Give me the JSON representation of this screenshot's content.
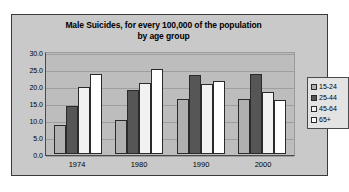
{
  "chart_data": {
    "type": "bar",
    "title": "Male Suicides, for every 100,000 of the population by age group",
    "title_line1": "Male Suicides, for every 100,000 of the population",
    "title_line2": "by age group",
    "xlabel": "",
    "ylabel": "",
    "ylim": [
      0,
      30
    ],
    "ytick_step": 5,
    "ytick_labels": [
      "30.0",
      "25.0",
      "20.0",
      "15.0",
      "10.0",
      "5.0",
      "0.0"
    ],
    "grid": true,
    "legend_position": "right",
    "categories": [
      "1974",
      "1980",
      "1990",
      "2000"
    ],
    "series": [
      {
        "name": "15-24",
        "color": "#b0b0b0",
        "values": [
          8.5,
          10.0,
          16.2,
          16.1
        ]
      },
      {
        "name": "25-44",
        "color": "#565656",
        "values": [
          14.0,
          18.8,
          23.2,
          23.5
        ]
      },
      {
        "name": "45-64",
        "color": "#f2f2f2",
        "values": [
          19.8,
          21.0,
          20.7,
          18.1
        ]
      },
      {
        "name": "65+",
        "color": "#ffffff",
        "values": [
          23.5,
          24.9,
          21.6,
          15.9
        ]
      }
    ],
    "colors": {
      "plot_background": "#bdbdbd",
      "chart_background": "#c9c9c9",
      "page_background": "#ffffff",
      "axis": "#4a4a4a",
      "gridline": "#9e9e9e",
      "bar_outline": "#2a2a2a",
      "legend_background": "#e3e3e3"
    }
  }
}
